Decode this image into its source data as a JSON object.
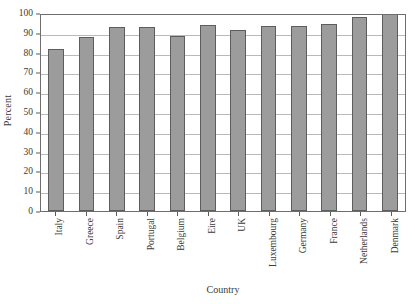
{
  "chart_data": {
    "type": "bar",
    "title": "",
    "subtitle": "",
    "xlabel": "Country",
    "ylabel": "Percent",
    "categories": [
      "Italy",
      "Greece",
      "Spain",
      "Portugal",
      "Belgium",
      "Eire",
      "UK",
      "Luxembourg",
      "Germany",
      "France",
      "Netherlands",
      "Denmark"
    ],
    "values": [
      82,
      88,
      93,
      93,
      88.5,
      94,
      91.5,
      93.5,
      93.5,
      94.5,
      98,
      99.5
    ],
    "ylim": [
      0,
      100
    ],
    "ytick_labels": [
      "0",
      "10",
      "20",
      "30",
      "40",
      "50",
      "60",
      "70",
      "80",
      "90",
      "100"
    ],
    "ytick_values": [
      0,
      10,
      20,
      30,
      40,
      50,
      60,
      70,
      80,
      90,
      100
    ],
    "grid": "horizontal",
    "legend": "none",
    "bar_color": "#9c9c9c",
    "bar_edge_color": "#5d5d5d",
    "grid_color": "#b9b9b9",
    "axis_color": "#6e6e6e",
    "background_color": "#ffffff"
  }
}
